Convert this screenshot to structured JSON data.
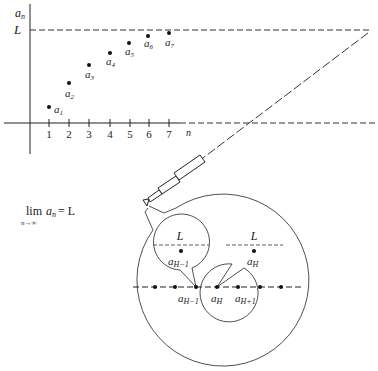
{
  "figure": {
    "y_axis_label": "a",
    "y_axis_label_sub": "n",
    "x_axis_label": "n",
    "limit_line_label": "L",
    "ticks": [
      "1",
      "2",
      "3",
      "4",
      "5",
      "6",
      "7"
    ],
    "points": [
      {
        "label": "a",
        "sub": "1"
      },
      {
        "label": "a",
        "sub": "2"
      },
      {
        "label": "a",
        "sub": "3"
      },
      {
        "label": "a",
        "sub": "4"
      },
      {
        "label": "a",
        "sub": "5"
      },
      {
        "label": "a",
        "sub": "6"
      },
      {
        "label": "a",
        "sub": "7"
      }
    ],
    "formula": {
      "lim": "lim",
      "sub": "n→∞",
      "expr_a": "a",
      "expr_sub": "n",
      "expr_rest": "= L"
    },
    "magnified": {
      "bubble_left": {
        "L": "L",
        "a": "a",
        "sub": "H−1"
      },
      "bubble_right": {
        "L": "L",
        "a": "a",
        "sub": "H"
      },
      "axis_labels": [
        {
          "a": "a",
          "sub": "H−1"
        },
        {
          "a": "a",
          "sub": "H"
        },
        {
          "a": "a",
          "sub": "H+1"
        }
      ]
    }
  }
}
